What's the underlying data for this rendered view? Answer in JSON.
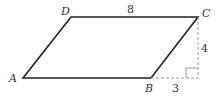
{
  "figure": {
    "shape": "parallelogram",
    "vertices": {
      "A": "A",
      "B": "B",
      "C": "C",
      "D": "D"
    },
    "labels": {
      "top_side": "8",
      "height": "4",
      "offset": "3"
    },
    "colors": {
      "stroke": "#222222",
      "dashed": "#999999",
      "text": "#333333"
    }
  }
}
